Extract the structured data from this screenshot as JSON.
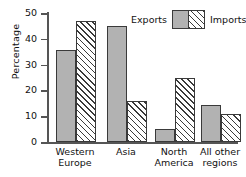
{
  "chart_data": {
    "type": "bar",
    "title": "",
    "xlabel": "",
    "ylabel": "Percentage",
    "ylim": [
      0,
      50
    ],
    "yticks": [
      0,
      10,
      20,
      30,
      40,
      50
    ],
    "grid": false,
    "legend_position": "top-right",
    "categories": [
      "Western Europe",
      "Asia",
      "North America",
      "All other regions"
    ],
    "category_lines": [
      [
        "Western",
        "Europe"
      ],
      [
        "Asia",
        ""
      ],
      [
        "North",
        "America"
      ],
      [
        "All other",
        "regions"
      ]
    ],
    "series": [
      {
        "name": "Exports",
        "values": [
          35.5,
          45,
          5,
          14.5
        ],
        "color": "#b2b2b2",
        "pattern": "solid-gray"
      },
      {
        "name": "Imports",
        "values": [
          47,
          16,
          25,
          11
        ],
        "color": "#ffffff",
        "pattern": "diagonal-hatch"
      }
    ]
  },
  "legend": {
    "exports_label": "Exports",
    "imports_label": "Imports"
  },
  "axis": {
    "y_title": "Percentage",
    "tick_labels": [
      "50",
      "40",
      "30",
      "20",
      "10",
      "0"
    ]
  },
  "colors": {
    "exports_fill": "#b2b2b2",
    "bar_border": "#3a3a3a",
    "axis": "#555555",
    "text": "#111111",
    "background": "#ffffff"
  }
}
